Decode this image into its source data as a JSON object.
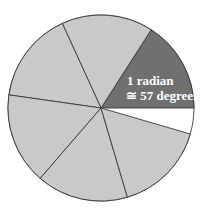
{
  "diagram": {
    "center": [
      101,
      108
    ],
    "radius": 93,
    "radian_count": 6,
    "radian_degrees": 57.2958,
    "colors": {
      "highlight": "#707070",
      "sector": "#c9c9c9",
      "gap": "#ffffff",
      "stroke": "#3a3a3a"
    },
    "label": {
      "line1": "1 radian",
      "line2": "≅ 57 degrees"
    }
  }
}
